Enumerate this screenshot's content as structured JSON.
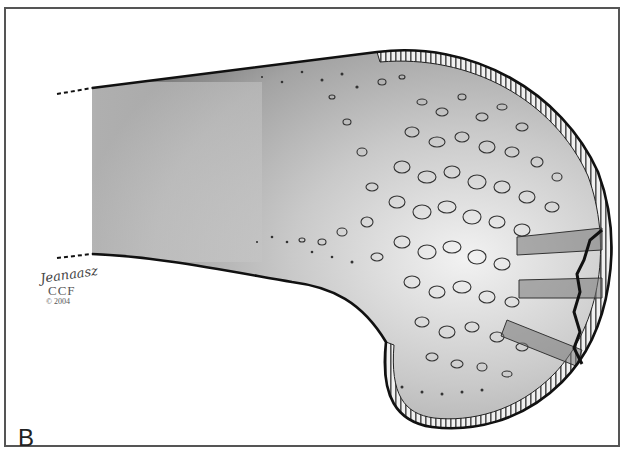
{
  "figure": {
    "panel_label": "B",
    "signature": {
      "name": "Jeanaasz",
      "organization": "CCF",
      "copyright": "© 2004"
    },
    "colors": {
      "frame": "#555555",
      "outline": "#111111",
      "bone_fill_light": "#e6e6e6",
      "bone_fill_dark": "#8a8a8a",
      "cartilage": "#d8d8d8",
      "drill_tract": "#6a6a6a"
    }
  }
}
